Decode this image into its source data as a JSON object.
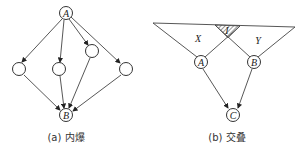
{
  "diagram_a": {
    "caption": "(a) 内爆",
    "nodes": [
      {
        "id": "A",
        "label": "A",
        "x": 66,
        "y": 13
      },
      {
        "id": "n1",
        "label": "",
        "x": 19,
        "y": 69
      },
      {
        "id": "n2",
        "label": "",
        "x": 59,
        "y": 69
      },
      {
        "id": "n3",
        "label": "",
        "x": 92,
        "y": 51
      },
      {
        "id": "n4",
        "label": "",
        "x": 126,
        "y": 69
      },
      {
        "id": "B",
        "label": "B",
        "x": 66,
        "y": 115
      }
    ],
    "edges": [
      [
        "A",
        "n1"
      ],
      [
        "A",
        "n2"
      ],
      [
        "A",
        "n3"
      ],
      [
        "A",
        "n4"
      ],
      [
        "n1",
        "B"
      ],
      [
        "n2",
        "B"
      ],
      [
        "n3",
        "B"
      ],
      [
        "n4",
        "B"
      ]
    ]
  },
  "diagram_b": {
    "caption": "(b) 交叠",
    "region_labels": {
      "x": "X",
      "y": "Y",
      "intersection": "I"
    },
    "nodes": [
      {
        "id": "A",
        "label": "A",
        "x": 201,
        "y": 62
      },
      {
        "id": "B",
        "label": "B",
        "x": 254,
        "y": 62
      },
      {
        "id": "C",
        "label": "C",
        "x": 233,
        "y": 115
      }
    ],
    "edges": [
      [
        "A",
        "C"
      ],
      [
        "B",
        "C"
      ]
    ]
  }
}
